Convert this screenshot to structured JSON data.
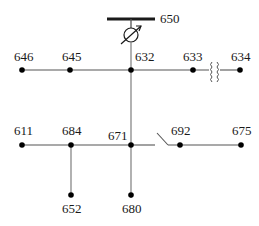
{
  "colors": {
    "line": "#1a1a1a",
    "feeder_line": "#888888",
    "node": "#000000"
  },
  "substation": {
    "label": "650"
  },
  "devices": {
    "regulator": {
      "name": "voltage-regulator",
      "between": [
        "650",
        "632"
      ]
    },
    "transformer": {
      "name": "in-line-transformer",
      "between": [
        "633",
        "634"
      ]
    },
    "switch": {
      "name": "switch",
      "between": [
        "671",
        "692"
      ],
      "state": "open"
    }
  },
  "nodes": [
    {
      "id": "646",
      "label": "646"
    },
    {
      "id": "645",
      "label": "645"
    },
    {
      "id": "632",
      "label": "632"
    },
    {
      "id": "633",
      "label": "633"
    },
    {
      "id": "634",
      "label": "634"
    },
    {
      "id": "611",
      "label": "611"
    },
    {
      "id": "684",
      "label": "684"
    },
    {
      "id": "671",
      "label": "671"
    },
    {
      "id": "692",
      "label": "692"
    },
    {
      "id": "675",
      "label": "675"
    },
    {
      "id": "652",
      "label": "652"
    },
    {
      "id": "680",
      "label": "680"
    }
  ],
  "edges": [
    [
      "650",
      "632"
    ],
    [
      "646",
      "645"
    ],
    [
      "645",
      "632"
    ],
    [
      "632",
      "633"
    ],
    [
      "633",
      "634"
    ],
    [
      "632",
      "671"
    ],
    [
      "611",
      "684"
    ],
    [
      "684",
      "671"
    ],
    [
      "671",
      "692"
    ],
    [
      "692",
      "675"
    ],
    [
      "684",
      "652"
    ],
    [
      "671",
      "680"
    ]
  ]
}
